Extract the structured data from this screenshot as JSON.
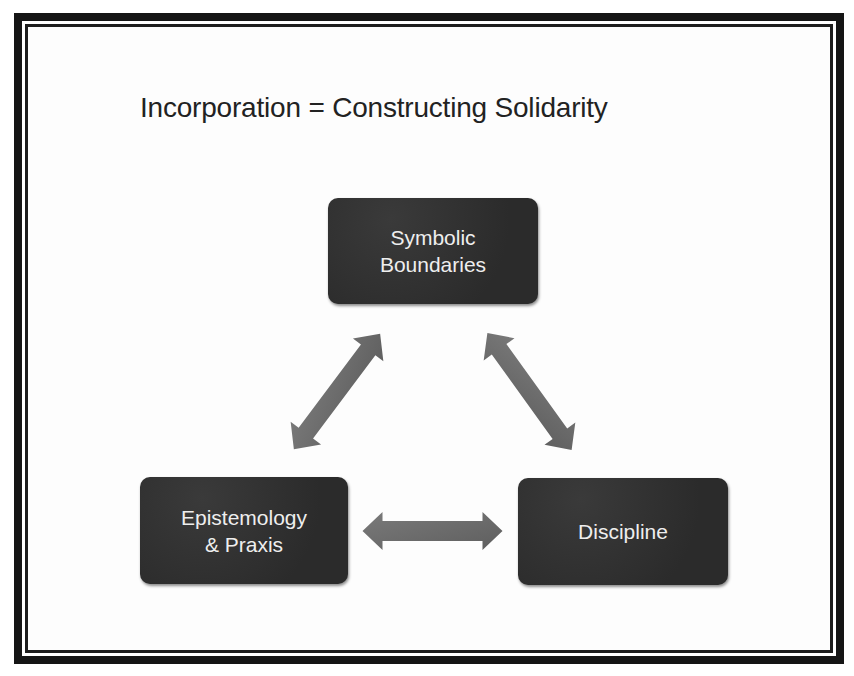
{
  "slide": {
    "title": "Incorporation = Constructing Solidarity"
  },
  "nodes": [
    {
      "id": "symbolic-boundaries",
      "lines": [
        "Symbolic",
        "Boundaries"
      ]
    },
    {
      "id": "epistemology-praxis",
      "lines": [
        "Epistemology",
        "& Praxis"
      ]
    },
    {
      "id": "discipline",
      "lines": [
        "Discipline"
      ]
    }
  ],
  "edges": [
    {
      "from": "symbolic-boundaries",
      "to": "epistemology-praxis",
      "type": "bidirectional"
    },
    {
      "from": "symbolic-boundaries",
      "to": "discipline",
      "type": "bidirectional"
    },
    {
      "from": "epistemology-praxis",
      "to": "discipline",
      "type": "bidirectional"
    }
  ],
  "colors": {
    "box_fill": "#2f2f2f",
    "box_text": "#eeeeee",
    "arrow_fill": "#707070",
    "border": "#151515",
    "title_text": "#222222"
  }
}
